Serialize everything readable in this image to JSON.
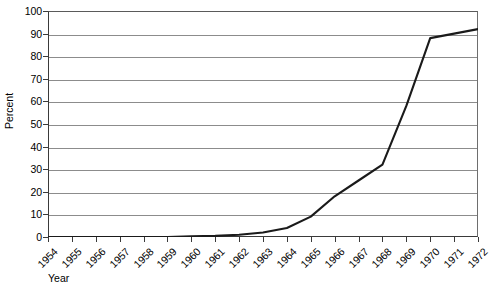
{
  "chart_data": {
    "type": "line",
    "title": "",
    "xlabel": "Year",
    "ylabel": "Percent",
    "xlim": [
      1954,
      1972
    ],
    "ylim": [
      0,
      100
    ],
    "grid": true,
    "legend": "none",
    "x": [
      1954,
      1955,
      1956,
      1957,
      1958,
      1959,
      1960,
      1961,
      1962,
      1963,
      1964,
      1965,
      1966,
      1967,
      1968,
      1969,
      1970,
      1971,
      1972
    ],
    "xtick_labels": [
      "1954",
      "1955",
      "1956",
      "1957",
      "1958",
      "1959",
      "1960",
      "1961",
      "1962",
      "1963",
      "1964",
      "1965",
      "1966",
      "1967",
      "1968",
      "1969",
      "1970",
      "1971",
      "1972"
    ],
    "ytick_labels": [
      "0",
      "10",
      "20",
      "30",
      "40",
      "50",
      "60",
      "70",
      "80",
      "90",
      "100"
    ],
    "ytick_values": [
      0,
      10,
      20,
      30,
      40,
      50,
      60,
      70,
      80,
      90,
      100
    ],
    "series": [
      {
        "name": "Percent",
        "color": "#1a1a1a",
        "values": [
          0,
          0,
          0,
          0,
          0,
          0,
          0.3,
          0.5,
          1,
          2,
          4,
          9,
          18,
          25,
          32,
          58,
          88,
          90,
          92
        ]
      }
    ]
  },
  "axis": {
    "y_title": "Percent",
    "x_title": "Year"
  },
  "style": {
    "line_color": "#1a1a1a",
    "grid_color": "#8c8c8c",
    "frame_color": "#3a3a3a",
    "background": "#ffffff"
  }
}
